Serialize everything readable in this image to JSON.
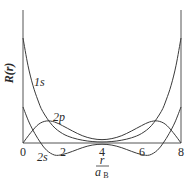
{
  "chart_data": {
    "type": "line",
    "title": "",
    "xlabel": "r / a_B",
    "ylabel": "R(r)",
    "xlim": [
      0,
      8
    ],
    "ylim": [
      -0.2,
      1.25
    ],
    "grid": false,
    "legend": "inline curve labels",
    "x_ticks": [
      "0",
      "2",
      "4",
      "6",
      "8"
    ],
    "series": [
      {
        "name": "1s",
        "points": [
          [
            0,
            1.0
          ],
          [
            0.25,
            0.74
          ],
          [
            0.5,
            0.55
          ],
          [
            0.75,
            0.41
          ],
          [
            1,
            0.3
          ],
          [
            1.5,
            0.165
          ],
          [
            2,
            0.09
          ],
          [
            2.5,
            0.05
          ],
          [
            3,
            0.027
          ],
          [
            3.5,
            0.014
          ],
          [
            4,
            0.01
          ],
          [
            4.5,
            0.014
          ],
          [
            5,
            0.027
          ],
          [
            5.5,
            0.05
          ],
          [
            6,
            0.09
          ],
          [
            6.5,
            0.165
          ],
          [
            7,
            0.3
          ],
          [
            7.25,
            0.41
          ],
          [
            7.5,
            0.55
          ],
          [
            7.75,
            0.74
          ],
          [
            8,
            1.0
          ]
        ]
      },
      {
        "name": "2s",
        "points": [
          [
            0,
            0.343
          ],
          [
            0.3,
            0.2
          ],
          [
            0.6,
            0.09
          ],
          [
            0.9,
            0.0
          ],
          [
            1.2,
            -0.07
          ],
          [
            1.6,
            -0.115
          ],
          [
            2,
            -0.11
          ],
          [
            2.5,
            -0.08
          ],
          [
            3,
            -0.045
          ],
          [
            3.5,
            -0.02
          ],
          [
            4,
            -0.012
          ],
          [
            4.5,
            -0.02
          ],
          [
            5,
            -0.045
          ],
          [
            5.5,
            -0.08
          ],
          [
            6,
            -0.11
          ],
          [
            6.4,
            -0.115
          ],
          [
            6.8,
            -0.07
          ],
          [
            7.1,
            0.0
          ],
          [
            7.4,
            0.09
          ],
          [
            7.7,
            0.2
          ],
          [
            8,
            0.343
          ]
        ]
      },
      {
        "name": "2p",
        "points": [
          [
            0,
            0.0
          ],
          [
            0.4,
            0.1
          ],
          [
            0.8,
            0.18
          ],
          [
            1.2,
            0.21
          ],
          [
            1.6,
            0.2
          ],
          [
            2,
            0.165
          ],
          [
            2.5,
            0.115
          ],
          [
            3,
            0.07
          ],
          [
            3.5,
            0.042
          ],
          [
            4,
            0.032
          ],
          [
            4.5,
            0.042
          ],
          [
            5,
            0.07
          ],
          [
            5.5,
            0.115
          ],
          [
            6,
            0.165
          ],
          [
            6.4,
            0.2
          ],
          [
            6.8,
            0.21
          ],
          [
            7.2,
            0.18
          ],
          [
            7.6,
            0.1
          ],
          [
            8,
            0.0
          ]
        ]
      }
    ],
    "annotations": [
      {
        "text": "1s",
        "x": 0.6,
        "y": 0.58
      },
      {
        "text": "2p",
        "x": 1.6,
        "y": 0.25
      },
      {
        "text": "2s",
        "x": 0.9,
        "y": -0.14
      }
    ]
  },
  "labels": {
    "y_axis": "R(r)",
    "x_axis_numerator": "r",
    "x_axis_denominator": "a",
    "x_axis_subscript": "B",
    "curve_1s": "1s",
    "curve_2s": "2s",
    "curve_2p": "2p",
    "tick_0": "0",
    "tick_2": "2",
    "tick_4": "4",
    "tick_6": "6",
    "tick_8": "8"
  }
}
